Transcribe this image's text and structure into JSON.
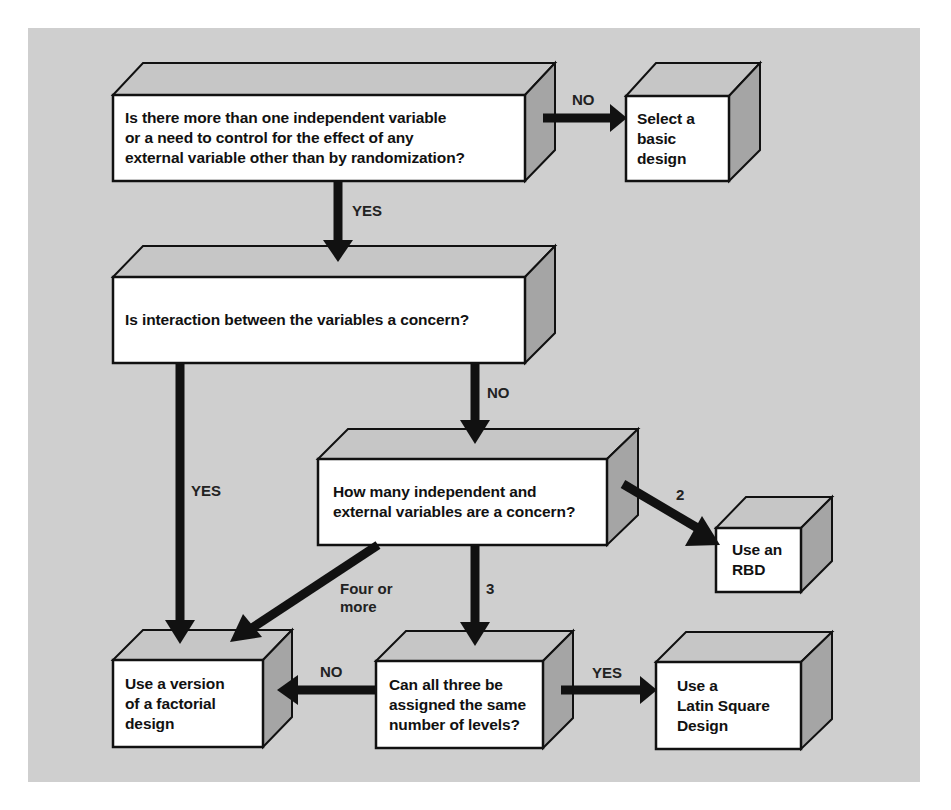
{
  "colors": {
    "background": "#cfcfcf",
    "box_front": "#ffffff",
    "box_top": "#c6c6c6",
    "box_side": "#a5a5a5",
    "stroke": "#111111",
    "arrow": "#111111"
  },
  "nodes": [
    {
      "id": "q1",
      "text": "Is there more than one independent variable\nor a need to control for the effect of any\nexternal variable other than by randomization?"
    },
    {
      "id": "basic",
      "text": "Select a\nbasic\ndesign"
    },
    {
      "id": "q2",
      "text": "Is interaction between the variables a concern?"
    },
    {
      "id": "q3",
      "text": "How many independent and\nexternal variables are a concern?"
    },
    {
      "id": "rbd",
      "text": "Use an\nRBD"
    },
    {
      "id": "factorial",
      "text": "Use a version\nof a factorial\ndesign"
    },
    {
      "id": "q4",
      "text": "Can all three be\nassigned the same\nnumber of levels?"
    },
    {
      "id": "latin",
      "text": "Use a\nLatin Square\nDesign"
    }
  ],
  "edges": [
    {
      "from": "q1",
      "to": "basic",
      "label": "NO"
    },
    {
      "from": "q1",
      "to": "q2",
      "label": "YES"
    },
    {
      "from": "q2",
      "to": "q3",
      "label": "NO"
    },
    {
      "from": "q2",
      "to": "factorial",
      "label": "YES"
    },
    {
      "from": "q3",
      "to": "rbd",
      "label": "2"
    },
    {
      "from": "q3",
      "to": "factorial",
      "label": "Four or\nmore"
    },
    {
      "from": "q3",
      "to": "q4",
      "label": "3"
    },
    {
      "from": "q4",
      "to": "factorial",
      "label": "NO"
    },
    {
      "from": "q4",
      "to": "latin",
      "label": "YES"
    }
  ]
}
